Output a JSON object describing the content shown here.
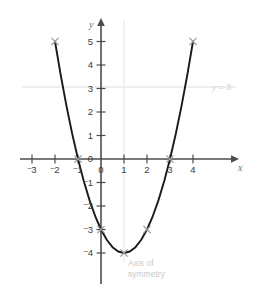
{
  "chart_data": {
    "type": "line",
    "title": "",
    "xlabel": "x",
    "ylabel": "y",
    "xlim": [
      -3.6,
      4.9
    ],
    "ylim": [
      -4.9,
      5.6
    ],
    "grid": false,
    "function": "y = (x - 1)^2 - 4",
    "x_ticks": [
      "-3",
      "-2",
      "-1",
      "0",
      "1",
      "2",
      "3",
      "4"
    ],
    "x_tick_values": [
      -3,
      -2,
      -1,
      0,
      1,
      2,
      3,
      4
    ],
    "y_ticks": [
      "5",
      "4",
      "3",
      "2",
      "1",
      "0",
      "-1",
      "-2",
      "-3",
      "-4"
    ],
    "y_tick_values": [
      5,
      4,
      3,
      2,
      1,
      0,
      -1,
      -2,
      -3,
      -4
    ],
    "marked_points": [
      {
        "x": -2,
        "y": 5
      },
      {
        "x": -1,
        "y": 0
      },
      {
        "x": 0,
        "y": -3
      },
      {
        "x": 1,
        "y": -4
      },
      {
        "x": 2,
        "y": -3
      },
      {
        "x": 3,
        "y": 0
      },
      {
        "x": 4,
        "y": 5
      }
    ],
    "curve_points": [
      {
        "x": -2.0,
        "y": 5.0
      },
      {
        "x": -1.75,
        "y": 3.5625
      },
      {
        "x": -1.5,
        "y": 2.25
      },
      {
        "x": -1.25,
        "y": 1.0625
      },
      {
        "x": -1.0,
        "y": 0.0
      },
      {
        "x": -0.75,
        "y": -0.9375
      },
      {
        "x": -0.5,
        "y": -1.75
      },
      {
        "x": -0.25,
        "y": -2.4375
      },
      {
        "x": 0.0,
        "y": -3.0
      },
      {
        "x": 0.25,
        "y": -3.4375
      },
      {
        "x": 0.5,
        "y": -3.75
      },
      {
        "x": 0.75,
        "y": -3.9375
      },
      {
        "x": 1.0,
        "y": -4.0
      },
      {
        "x": 1.25,
        "y": -3.9375
      },
      {
        "x": 1.5,
        "y": -3.75
      },
      {
        "x": 1.75,
        "y": -3.4375
      },
      {
        "x": 2.0,
        "y": -3.0
      },
      {
        "x": 2.25,
        "y": -2.4375
      },
      {
        "x": 2.5,
        "y": -1.75
      },
      {
        "x": 2.75,
        "y": -0.9375
      },
      {
        "x": 3.0,
        "y": 0.0
      },
      {
        "x": 3.25,
        "y": 1.0625
      },
      {
        "x": 3.5,
        "y": 2.25
      },
      {
        "x": 3.75,
        "y": 3.5625
      },
      {
        "x": 4.0,
        "y": 5.0
      }
    ],
    "annotations": [
      {
        "name": "horizontal-line-y3",
        "text": "y = 3",
        "value": 3,
        "orientation": "horizontal"
      },
      {
        "name": "axis-of-symmetry",
        "text": "Axis of symmetry",
        "value": 1,
        "orientation": "vertical"
      }
    ],
    "legend_position": "none"
  },
  "labels": {
    "x_axis_name": "x",
    "y_axis_name": "y",
    "level_line_prefix": "y",
    "level_line_equals": " = 3",
    "axis_of_symmetry_line1": "Axis of",
    "axis_of_symmetry_line2": "symmetry"
  },
  "x_tick_labels": [
    {
      "text": "-3",
      "minus": "⁻",
      "digit": "3"
    },
    {
      "text": "-2",
      "minus": "⁻",
      "digit": "2"
    },
    {
      "text": "-1",
      "minus": "⁻",
      "digit": "1"
    },
    {
      "text": "0",
      "minus": "",
      "digit": "0"
    },
    {
      "text": "1",
      "minus": "",
      "digit": "1"
    },
    {
      "text": "2",
      "minus": "",
      "digit": "2"
    },
    {
      "text": "3",
      "minus": "",
      "digit": "3"
    },
    {
      "text": "4",
      "minus": "",
      "digit": "4"
    }
  ],
  "y_tick_labels": [
    {
      "text": "5",
      "minus": "",
      "digit": "5"
    },
    {
      "text": "4",
      "minus": "",
      "digit": "4"
    },
    {
      "text": "3",
      "minus": "",
      "digit": "3"
    },
    {
      "text": "2",
      "minus": "",
      "digit": "2"
    },
    {
      "text": "1",
      "minus": "",
      "digit": "1"
    },
    {
      "text": "0",
      "minus": "",
      "digit": "0"
    },
    {
      "text": "-1",
      "minus": "⁻",
      "digit": "1"
    },
    {
      "text": "-2",
      "minus": "⁻",
      "digit": "2"
    },
    {
      "text": "-3",
      "minus": "⁻",
      "digit": "3"
    },
    {
      "text": "-4",
      "minus": "⁻",
      "digit": "4"
    }
  ],
  "colors": {
    "curve": "#1a1a1a",
    "axis": "#4d4d4d",
    "tick_text": "#3a3a3a",
    "marker": "#9b9b9b",
    "guide_line": "#e6e6e6",
    "guide_text": "#cfcfcf",
    "background": "#ffffff"
  }
}
